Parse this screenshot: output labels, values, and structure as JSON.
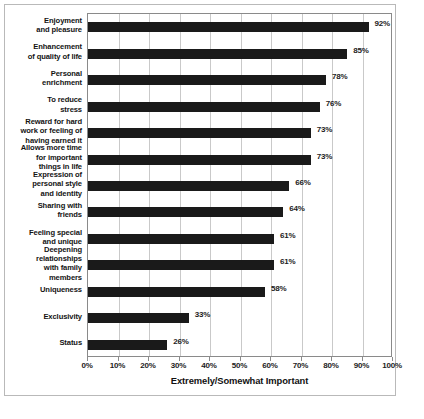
{
  "chart_data": {
    "type": "bar",
    "orientation": "horizontal",
    "title": "",
    "xlabel": "Extremely/Somewhat Important",
    "ylabel": "",
    "xlim": [
      0,
      100
    ],
    "xticks": [
      "0%",
      "10%",
      "20%",
      "30%",
      "40%",
      "50%",
      "60%",
      "70%",
      "80%",
      "90%",
      "100%"
    ],
    "xtick_values": [
      0,
      10,
      20,
      30,
      40,
      50,
      60,
      70,
      80,
      90,
      100
    ],
    "grid": "vertical",
    "legend": "none",
    "bar_color": "#1a1a1a",
    "categories": [
      "Enjoyment and pleasure",
      "Enhancement of quality of life",
      "Personal enrichment",
      "To reduce stress",
      "Reward for hard work or feeling of having earned it",
      "Allows more time for important things in life",
      "Expression of personal style and identity",
      "Sharing with friends",
      "Feeling special and unique",
      "Deepening relationships with family members",
      "Uniqueness",
      "Exclusivity",
      "Status"
    ],
    "category_lines": [
      [
        "Enjoyment",
        "and pleasure"
      ],
      [
        "Enhancement",
        "of quality of life"
      ],
      [
        "Personal",
        "enrichment"
      ],
      [
        "To reduce",
        "stress"
      ],
      [
        "Reward for hard",
        "work or feeling of",
        "having earned it"
      ],
      [
        "Allows more time",
        "for important",
        "things in life"
      ],
      [
        "Expression of",
        "personal style",
        "and identity"
      ],
      [
        "Sharing with",
        "friends"
      ],
      [
        "Feeling special",
        "and unique"
      ],
      [
        "Deepening",
        "relationships",
        "with family",
        "members"
      ],
      [
        "Uniqueness"
      ],
      [
        "Exclusivity"
      ],
      [
        "Status"
      ]
    ],
    "values": [
      92,
      85,
      78,
      76,
      73,
      73,
      66,
      64,
      61,
      61,
      58,
      33,
      26
    ],
    "value_labels": [
      "92%",
      "85%",
      "78%",
      "76%",
      "73%",
      "73%",
      "66%",
      "64%",
      "61%",
      "61%",
      "58%",
      "33%",
      "26%"
    ]
  }
}
